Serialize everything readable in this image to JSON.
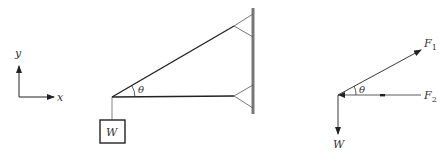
{
  "axes": {
    "x_label": "x",
    "y_label": "y"
  },
  "structure": {
    "weight_label": "W",
    "angle_label": "θ"
  },
  "free_body": {
    "force1_label": "F",
    "force1_sub": "1",
    "force2_label": "F",
    "force2_sub": "2",
    "weight_label": "W",
    "angle_label": "θ"
  },
  "colors": {
    "line": "#222222",
    "wall": "#777777",
    "thin": "#555555"
  }
}
